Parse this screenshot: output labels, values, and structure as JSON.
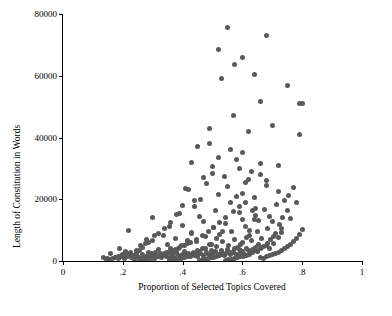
{
  "chart_data": {
    "type": "scatter",
    "title": "",
    "xlabel": "Proportion of Selected Topics Covered",
    "ylabel": "Length of Constitution in Words",
    "xlim": [
      0,
      1
    ],
    "ylim": [
      0,
      80000
    ],
    "xticks": [
      0,
      0.2,
      0.4,
      0.6,
      0.8,
      1
    ],
    "xticklabels": [
      "0",
      ".2",
      ".4",
      ".6",
      ".8",
      "1"
    ],
    "yticks": [
      0,
      20000,
      40000,
      60000,
      80000
    ],
    "yticklabels": [
      "0",
      "20000",
      "40000",
      "60000",
      "80000"
    ],
    "grid": false,
    "legend": null,
    "marker_color": "#595959",
    "points": [
      [
        0.135,
        1200
      ],
      [
        0.15,
        900
      ],
      [
        0.16,
        2500
      ],
      [
        0.175,
        1100
      ],
      [
        0.185,
        700
      ],
      [
        0.19,
        4200
      ],
      [
        0.195,
        1500
      ],
      [
        0.2,
        2100
      ],
      [
        0.205,
        800
      ],
      [
        0.21,
        3000
      ],
      [
        0.215,
        1300
      ],
      [
        0.22,
        9800
      ],
      [
        0.225,
        2200
      ],
      [
        0.23,
        1000
      ],
      [
        0.235,
        1800
      ],
      [
        0.24,
        600
      ],
      [
        0.245,
        2600
      ],
      [
        0.25,
        1400
      ],
      [
        0.255,
        3400
      ],
      [
        0.26,
        900
      ],
      [
        0.265,
        2000
      ],
      [
        0.27,
        1200
      ],
      [
        0.275,
        5600
      ],
      [
        0.28,
        1600
      ],
      [
        0.285,
        2800
      ],
      [
        0.29,
        1000
      ],
      [
        0.295,
        2300
      ],
      [
        0.3,
        1500
      ],
      [
        0.3,
        6800
      ],
      [
        0.305,
        900
      ],
      [
        0.31,
        2700
      ],
      [
        0.315,
        1300
      ],
      [
        0.32,
        3600
      ],
      [
        0.325,
        1800
      ],
      [
        0.33,
        1100
      ],
      [
        0.335,
        8200
      ],
      [
        0.34,
        2400
      ],
      [
        0.345,
        1600
      ],
      [
        0.35,
        5200
      ],
      [
        0.35,
        2900
      ],
      [
        0.355,
        1200
      ],
      [
        0.36,
        3900
      ],
      [
        0.365,
        2100
      ],
      [
        0.37,
        1400
      ],
      [
        0.375,
        7400
      ],
      [
        0.38,
        2600
      ],
      [
        0.385,
        1800
      ],
      [
        0.39,
        4400
      ],
      [
        0.395,
        1300
      ],
      [
        0.4,
        2200
      ],
      [
        0.4,
        11500
      ],
      [
        0.405,
        3100
      ],
      [
        0.41,
        1700
      ],
      [
        0.415,
        5800
      ],
      [
        0.42,
        2400
      ],
      [
        0.425,
        1500
      ],
      [
        0.43,
        9100
      ],
      [
        0.435,
        2800
      ],
      [
        0.44,
        1900
      ],
      [
        0.445,
        6200
      ],
      [
        0.45,
        3300
      ],
      [
        0.45,
        1600
      ],
      [
        0.455,
        14500
      ],
      [
        0.46,
        2500
      ],
      [
        0.465,
        4100
      ],
      [
        0.47,
        1800
      ],
      [
        0.475,
        7900
      ],
      [
        0.48,
        2900
      ],
      [
        0.485,
        2000
      ],
      [
        0.49,
        5400
      ],
      [
        0.49,
        38000
      ],
      [
        0.495,
        3500
      ],
      [
        0.5,
        2300
      ],
      [
        0.5,
        1700
      ],
      [
        0.505,
        10800
      ],
      [
        0.51,
        3000
      ],
      [
        0.515,
        4800
      ],
      [
        0.52,
        2100
      ],
      [
        0.525,
        8600
      ],
      [
        0.53,
        3400
      ],
      [
        0.53,
        2400
      ],
      [
        0.535,
        6400
      ],
      [
        0.54,
        1900
      ],
      [
        0.545,
        12300
      ],
      [
        0.55,
        3800
      ],
      [
        0.55,
        2600
      ],
      [
        0.555,
        5100
      ],
      [
        0.56,
        2200
      ],
      [
        0.565,
        9400
      ],
      [
        0.57,
        3200
      ],
      [
        0.57,
        2800
      ],
      [
        0.575,
        7100
      ],
      [
        0.58,
        2000
      ],
      [
        0.585,
        4500
      ],
      [
        0.59,
        3600
      ],
      [
        0.59,
        15600
      ],
      [
        0.595,
        2700
      ],
      [
        0.6,
        5900
      ],
      [
        0.6,
        3100
      ],
      [
        0.605,
        2400
      ],
      [
        0.61,
        11200
      ],
      [
        0.615,
        4000
      ],
      [
        0.62,
        3300
      ],
      [
        0.625,
        8100
      ],
      [
        0.63,
        2900
      ],
      [
        0.63,
        6600
      ],
      [
        0.635,
        3700
      ],
      [
        0.64,
        13400
      ],
      [
        0.645,
        4300
      ],
      [
        0.65,
        3000
      ],
      [
        0.65,
        9700
      ],
      [
        0.655,
        5300
      ],
      [
        0.66,
        3900
      ],
      [
        0.665,
        7300
      ],
      [
        0.67,
        4600
      ],
      [
        0.675,
        16800
      ],
      [
        0.68,
        5000
      ],
      [
        0.685,
        10400
      ],
      [
        0.69,
        4200
      ],
      [
        0.695,
        6900
      ],
      [
        0.7,
        12900
      ],
      [
        0.705,
        5700
      ],
      [
        0.71,
        8800
      ],
      [
        0.715,
        18200
      ],
      [
        0.72,
        7600
      ],
      [
        0.725,
        11800
      ],
      [
        0.73,
        9200
      ],
      [
        0.735,
        14100
      ],
      [
        0.74,
        19500
      ],
      [
        0.75,
        16200
      ],
      [
        0.755,
        21300
      ],
      [
        0.76,
        13700
      ],
      [
        0.77,
        23800
      ],
      [
        0.78,
        18900
      ],
      [
        0.79,
        41000
      ],
      [
        0.8,
        51000
      ],
      [
        0.75,
        57000
      ],
      [
        0.72,
        31000
      ],
      [
        0.68,
        24500
      ],
      [
        0.66,
        28000
      ],
      [
        0.64,
        20500
      ],
      [
        0.62,
        26500
      ],
      [
        0.6,
        22000
      ],
      [
        0.58,
        33000
      ],
      [
        0.56,
        19000
      ],
      [
        0.54,
        27500
      ],
      [
        0.52,
        21500
      ],
      [
        0.5,
        30500
      ],
      [
        0.48,
        25000
      ],
      [
        0.46,
        20000
      ],
      [
        0.44,
        17500
      ],
      [
        0.42,
        23000
      ],
      [
        0.4,
        18000
      ],
      [
        0.38,
        15000
      ],
      [
        0.36,
        12500
      ],
      [
        0.34,
        10500
      ],
      [
        0.32,
        8800
      ],
      [
        0.3,
        14000
      ],
      [
        0.28,
        7000
      ],
      [
        0.26,
        5000
      ],
      [
        0.55,
        75500
      ],
      [
        0.68,
        73000
      ],
      [
        0.52,
        68500
      ],
      [
        0.6,
        66000
      ],
      [
        0.575,
        63500
      ],
      [
        0.64,
        60500
      ],
      [
        0.53,
        59000
      ],
      [
        0.66,
        51500
      ],
      [
        0.79,
        51000
      ],
      [
        0.7,
        44000
      ],
      [
        0.57,
        47000
      ],
      [
        0.49,
        43000
      ],
      [
        0.62,
        42000
      ],
      [
        0.45,
        37000
      ],
      [
        0.56,
        36000
      ],
      [
        0.6,
        35000
      ],
      [
        0.52,
        33500
      ],
      [
        0.43,
        32000
      ],
      [
        0.66,
        31500
      ],
      [
        0.59,
        30000
      ],
      [
        0.63,
        29000
      ],
      [
        0.5,
        28500
      ],
      [
        0.47,
        27000
      ],
      [
        0.68,
        26000
      ],
      [
        0.61,
        25500
      ],
      [
        0.55,
        24000
      ],
      [
        0.41,
        23500
      ],
      [
        0.72,
        22500
      ],
      [
        0.58,
        21000
      ],
      [
        0.44,
        19500
      ],
      [
        0.645,
        17000
      ],
      [
        0.51,
        16500
      ],
      [
        0.39,
        15500
      ],
      [
        0.69,
        14500
      ],
      [
        0.6,
        13500
      ],
      [
        0.47,
        12700
      ],
      [
        0.355,
        11300
      ],
      [
        0.73,
        10600
      ],
      [
        0.625,
        10000
      ],
      [
        0.535,
        9500
      ],
      [
        0.43,
        9000
      ],
      [
        0.305,
        8400
      ],
      [
        0.705,
        7800
      ],
      [
        0.615,
        7500
      ],
      [
        0.515,
        7200
      ],
      [
        0.415,
        6700
      ],
      [
        0.285,
        6100
      ],
      [
        0.685,
        5800
      ],
      [
        0.595,
        5500
      ],
      [
        0.495,
        5300
      ],
      [
        0.395,
        4900
      ],
      [
        0.265,
        4500
      ],
      [
        0.665,
        4400
      ],
      [
        0.575,
        4200
      ],
      [
        0.475,
        4000
      ],
      [
        0.375,
        3800
      ],
      [
        0.245,
        3500
      ],
      [
        0.645,
        3400
      ],
      [
        0.555,
        3200
      ],
      [
        0.455,
        3100
      ],
      [
        0.355,
        2900
      ],
      [
        0.225,
        2700
      ],
      [
        0.635,
        2600
      ],
      [
        0.545,
        2500
      ],
      [
        0.445,
        2400
      ],
      [
        0.345,
        2300
      ],
      [
        0.215,
        2200
      ],
      [
        0.625,
        2100
      ],
      [
        0.535,
        2000
      ],
      [
        0.435,
        1950
      ],
      [
        0.335,
        1900
      ],
      [
        0.205,
        1850
      ],
      [
        0.615,
        1800
      ],
      [
        0.525,
        1750
      ],
      [
        0.425,
        1700
      ],
      [
        0.325,
        1650
      ],
      [
        0.195,
        1600
      ],
      [
        0.605,
        1550
      ],
      [
        0.515,
        1500
      ],
      [
        0.415,
        1450
      ],
      [
        0.315,
        1400
      ],
      [
        0.185,
        1350
      ],
      [
        0.595,
        1300
      ],
      [
        0.505,
        1250
      ],
      [
        0.405,
        1200
      ],
      [
        0.305,
        1150
      ],
      [
        0.175,
        1100
      ],
      [
        0.585,
        1050
      ],
      [
        0.495,
        1000
      ],
      [
        0.395,
        950
      ],
      [
        0.295,
        900
      ],
      [
        0.165,
        850
      ],
      [
        0.575,
        800
      ],
      [
        0.485,
        750
      ],
      [
        0.385,
        700
      ],
      [
        0.285,
        650
      ],
      [
        0.155,
        600
      ],
      [
        0.565,
        550
      ],
      [
        0.475,
        520
      ],
      [
        0.375,
        480
      ],
      [
        0.275,
        450
      ],
      [
        0.145,
        420
      ],
      [
        0.555,
        400
      ],
      [
        0.465,
        380
      ],
      [
        0.365,
        350
      ],
      [
        0.265,
        330
      ],
      [
        0.545,
        300
      ],
      [
        0.455,
        280
      ],
      [
        0.355,
        260
      ],
      [
        0.255,
        240
      ],
      [
        0.66,
        1100
      ],
      [
        0.67,
        900
      ],
      [
        0.68,
        1400
      ],
      [
        0.69,
        1700
      ],
      [
        0.7,
        2000
      ],
      [
        0.71,
        2400
      ],
      [
        0.72,
        2800
      ],
      [
        0.73,
        3300
      ],
      [
        0.74,
        3900
      ],
      [
        0.75,
        4600
      ],
      [
        0.76,
        5400
      ],
      [
        0.77,
        6300
      ],
      [
        0.78,
        7400
      ],
      [
        0.79,
        8700
      ],
      [
        0.8,
        10200
      ],
      [
        0.655,
        13000
      ],
      [
        0.645,
        14800
      ],
      [
        0.635,
        16500
      ],
      [
        0.61,
        19000
      ],
      [
        0.59,
        17800
      ],
      [
        0.57,
        16000
      ],
      [
        0.545,
        14200
      ],
      [
        0.525,
        12400
      ],
      [
        0.505,
        11000
      ],
      [
        0.485,
        9600
      ],
      [
        0.465,
        8300
      ],
      [
        0.445,
        7100
      ],
      [
        0.425,
        6000
      ],
      [
        0.405,
        5000
      ],
      [
        0.385,
        4200
      ],
      [
        0.365,
        3500
      ],
      [
        0.345,
        2900
      ],
      [
        0.325,
        2400
      ],
      [
        0.305,
        2000
      ]
    ]
  }
}
